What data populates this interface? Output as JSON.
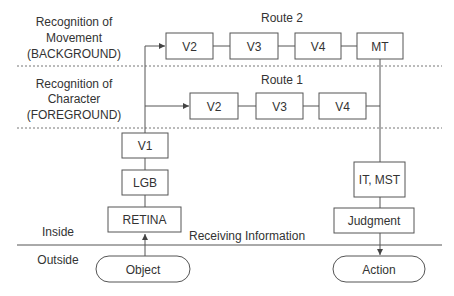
{
  "regions": {
    "movement": {
      "line1": "Recognition of",
      "line2": "Movement",
      "line3": "(BACKGROUND)"
    },
    "character": {
      "line1": "Recognition of",
      "line2": "Character",
      "line3": "(FOREGROUND)"
    },
    "inside": "Inside",
    "outside": "Outside"
  },
  "routes": {
    "route2": {
      "title": "Route 2",
      "boxes": [
        "V2",
        "V3",
        "V4",
        "MT"
      ]
    },
    "route1": {
      "title": "Route 1",
      "boxes": [
        "V2",
        "V3",
        "V4"
      ]
    }
  },
  "pathway": {
    "v1": "V1",
    "lgb": "LGB",
    "retina": "RETINA",
    "object": "Object"
  },
  "output": {
    "it_mst": "IT, MST",
    "judgment": "Judgment",
    "action": "Action"
  },
  "boundary_label": "Receiving Information",
  "colors": {
    "line": "#555555",
    "text": "#333333",
    "background": "#ffffff"
  }
}
